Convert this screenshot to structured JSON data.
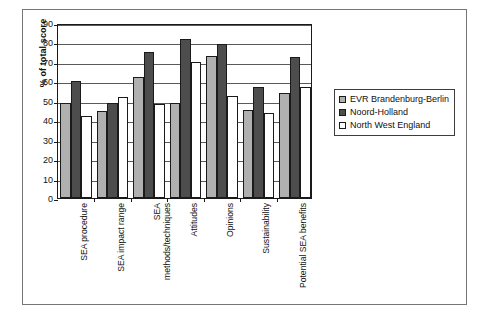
{
  "chart_data": {
    "type": "bar",
    "title": "",
    "subtitle": "",
    "xlabel": "",
    "ylabel": "% of total score",
    "ylim": [
      0,
      90
    ],
    "yticks": [
      0,
      10,
      20,
      30,
      40,
      50,
      60,
      70,
      80,
      90
    ],
    "grid": true,
    "legend_position": "right",
    "categories": [
      "SEA procedure",
      "SEA impact range",
      "SEA methods/techniques",
      "Attitudes",
      "Opinions",
      "Sustainability",
      "Potential SEA benefits"
    ],
    "series": [
      {
        "name": "EVR Brandenburg-Berlin",
        "color": "#b0b0b0",
        "values": [
          49,
          45,
          62,
          49,
          73,
          45.5,
          54
        ]
      },
      {
        "name": "Noord-Holland",
        "color": "#4d4d4d",
        "values": [
          60,
          49,
          75,
          82,
          79,
          57,
          72.5
        ]
      },
      {
        "name": "North West England",
        "color": "#ffffff",
        "values": [
          42,
          52,
          48.5,
          70,
          52.5,
          43.5,
          57
        ]
      }
    ]
  },
  "legend": {
    "items": [
      {
        "label": "EVR Brandenburg-Berlin",
        "swatch": "#b0b0b0"
      },
      {
        "label": "Noord-Holland",
        "swatch": "#4d4d4d"
      },
      {
        "label": "North West England",
        "swatch": "#ffffff"
      }
    ]
  },
  "colors": {
    "series_1": "#b0b0b0",
    "series_2": "#4d4d4d",
    "series_3": "#ffffff",
    "axis": "#1a1a1a",
    "grid": "#5a5a5a",
    "background": "#ffffff"
  }
}
